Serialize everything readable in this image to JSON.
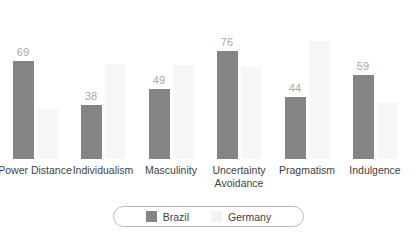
{
  "chart_data": {
    "type": "bar",
    "title": "",
    "subtitle": "",
    "xlabel": "",
    "ylabel": "",
    "ylim": [
      0,
      100
    ],
    "grid": false,
    "legend_position": "bottom",
    "categories": [
      "Power Distance",
      "Individualism",
      "Masculinity",
      "Uncertainty Avoidance",
      "Pragmatism",
      "Indulgence"
    ],
    "series": [
      {
        "name": "Brazil",
        "color": "#858585",
        "values": [
          69,
          38,
          49,
          76,
          44,
          59
        ],
        "labels_shown": true
      },
      {
        "name": "Germany",
        "color": "#f7f7f7",
        "values": [
          35,
          67,
          66,
          65,
          83,
          40
        ],
        "labels_shown": false
      }
    ]
  },
  "legend": {
    "items": [
      {
        "label": "Brazil",
        "swatch": "swatch-brazil"
      },
      {
        "label": "Germany",
        "swatch": "swatch-germany"
      }
    ]
  },
  "colors": {
    "brazil": "#858585",
    "germany": "#f7f7f7",
    "value_label": "#a8a8a8",
    "category_label": "#3f3f3f",
    "legend_border": "#b9b9b9",
    "background": "#ffffff"
  }
}
